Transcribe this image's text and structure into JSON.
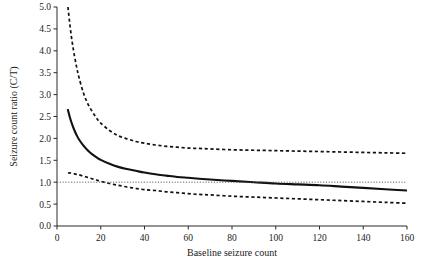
{
  "chart_data": {
    "type": "line",
    "title": "",
    "xlabel": "Baseline seizure count",
    "ylabel": "Seizure count ratio (C/T)",
    "xlim": [
      0,
      160
    ],
    "ylim": [
      0.0,
      5.0
    ],
    "xticks": [
      0,
      20,
      40,
      60,
      80,
      100,
      120,
      140,
      160
    ],
    "xtick_labels": [
      "0",
      "20",
      "40",
      "60",
      "80",
      "100",
      "120",
      "140",
      "160"
    ],
    "yticks": [
      0.0,
      0.5,
      1.0,
      1.5,
      2.0,
      2.5,
      3.0,
      3.5,
      4.0,
      4.5,
      5.0
    ],
    "ytick_labels": [
      "0.0",
      "0.5",
      "1.0",
      "1.5",
      "2.0",
      "2.5",
      "3.0",
      "3.5",
      "4.0",
      "4.5",
      "5.0"
    ],
    "grid": false,
    "legend": "none",
    "reference_line": {
      "name": "null-ratio-reference",
      "orientation": "horizontal",
      "y": 1.0,
      "style": "dotted",
      "color": "#555555"
    },
    "x": [
      5,
      6,
      7,
      8,
      9,
      10,
      12,
      14,
      16,
      18,
      20,
      24,
      28,
      32,
      36,
      40,
      45,
      50,
      55,
      60,
      65,
      70,
      80,
      90,
      100,
      110,
      120,
      130,
      140,
      150,
      160
    ],
    "series": [
      {
        "name": "Upper confidence limit",
        "style": "dashed",
        "color": "#111111",
        "values": [
          5.0,
          4.55,
          4.18,
          3.88,
          3.62,
          3.4,
          3.05,
          2.8,
          2.62,
          2.47,
          2.35,
          2.18,
          2.06,
          1.99,
          1.93,
          1.89,
          1.85,
          1.82,
          1.8,
          1.78,
          1.77,
          1.76,
          1.74,
          1.73,
          1.72,
          1.71,
          1.7,
          1.69,
          1.68,
          1.67,
          1.66
        ]
      },
      {
        "name": "Point estimate",
        "style": "solid",
        "color": "#111111",
        "values": [
          2.65,
          2.46,
          2.31,
          2.18,
          2.07,
          1.98,
          1.84,
          1.73,
          1.64,
          1.57,
          1.51,
          1.42,
          1.35,
          1.3,
          1.26,
          1.22,
          1.18,
          1.15,
          1.12,
          1.1,
          1.08,
          1.06,
          1.03,
          1.0,
          0.97,
          0.95,
          0.93,
          0.9,
          0.87,
          0.84,
          0.81
        ]
      },
      {
        "name": "Lower confidence limit",
        "style": "dashed",
        "color": "#111111",
        "values": [
          1.21,
          1.21,
          1.2,
          1.19,
          1.18,
          1.17,
          1.14,
          1.11,
          1.08,
          1.05,
          1.02,
          0.97,
          0.93,
          0.89,
          0.86,
          0.83,
          0.81,
          0.78,
          0.76,
          0.74,
          0.72,
          0.71,
          0.68,
          0.66,
          0.64,
          0.62,
          0.6,
          0.58,
          0.56,
          0.54,
          0.52
        ]
      }
    ]
  }
}
